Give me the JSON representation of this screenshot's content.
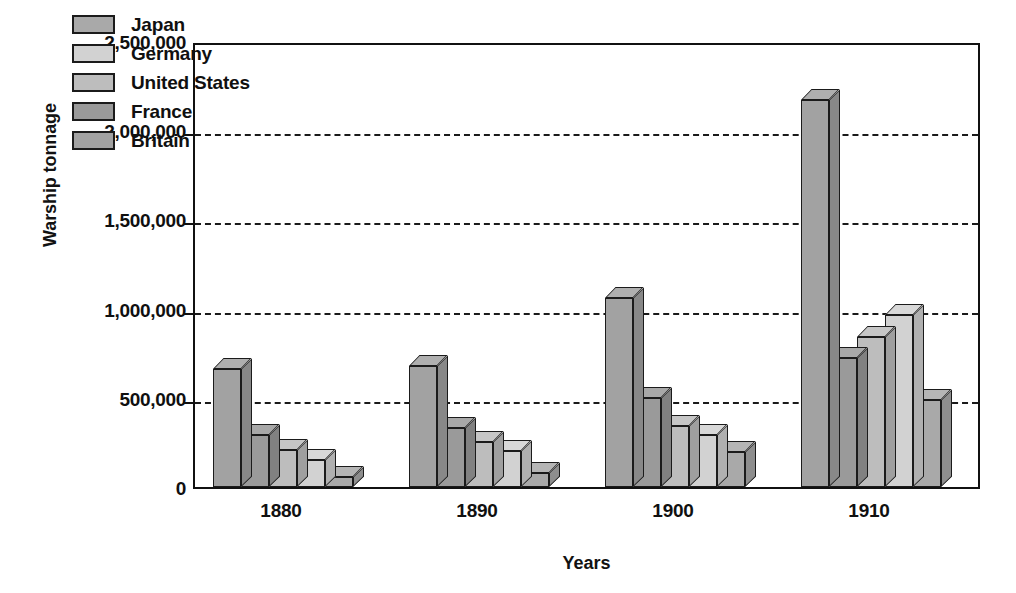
{
  "chart_data": {
    "type": "bar",
    "title": "",
    "xlabel": "Years",
    "ylabel": "Warship tonnage",
    "categories": [
      "1880",
      "1890",
      "1900",
      "1910"
    ],
    "ylim": [
      0,
      2500000
    ],
    "ytick_values": [
      0,
      500000,
      1000000,
      1500000,
      2000000,
      2500000
    ],
    "ytick_labels": [
      "0",
      "500,000",
      "1,000,000",
      "1,500,000",
      "2,000,000",
      "2,500,000"
    ],
    "grid": true,
    "gridlines_at": [
      500000,
      1000000,
      1500000,
      2000000
    ],
    "legend_position": "top-left-inside",
    "style": "3d-bar",
    "legend_entries": [
      "Japan",
      "Germany",
      "United States",
      "France",
      "Britain"
    ],
    "bar_order_in_group": [
      "Britain",
      "France",
      "United States",
      "Germany",
      "Japan"
    ],
    "series": [
      {
        "name": "Japan",
        "color": "#a9a9a9",
        "values": [
          55000,
          80000,
          195000,
          485000
        ]
      },
      {
        "name": "Germany",
        "color": "#d2d2d2",
        "values": [
          150000,
          200000,
          290000,
          965000
        ]
      },
      {
        "name": "United States",
        "color": "#bdbdbd",
        "values": [
          205000,
          255000,
          340000,
          840000
        ]
      },
      {
        "name": "France",
        "color": "#9a9a9a",
        "values": [
          290000,
          330000,
          500000,
          725000
        ]
      },
      {
        "name": "Britain",
        "color": "#a2a2a2",
        "values": [
          660000,
          680000,
          1060000,
          2170000
        ]
      }
    ]
  },
  "axis": {
    "y_title": "Warship tonnage",
    "x_title": "Years"
  },
  "colors": {
    "japan": "#a9a9a9",
    "germany": "#d2d2d2",
    "united_states": "#bdbdbd",
    "france": "#9a9a9a",
    "britain": "#a2a2a2",
    "outline": "#1b1b1b",
    "background": "#ffffff"
  }
}
